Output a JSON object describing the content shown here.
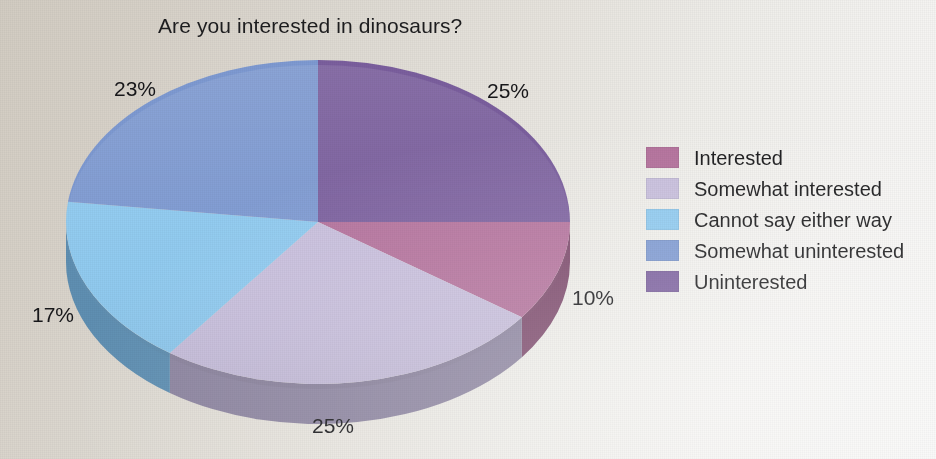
{
  "chart_data": {
    "type": "pie",
    "title": "Are you interested in dinosaurs?",
    "xlabel": "",
    "ylabel": "",
    "legend_position": "right",
    "grid": false,
    "three_d": true,
    "categories": [
      "Interested",
      "Somewhat interested",
      "Cannot say either way",
      "Somewhat uninterested",
      "Uninterested"
    ],
    "values": [
      10,
      25,
      17,
      23,
      25
    ],
    "value_labels": [
      "10%",
      "25%",
      "17%",
      "23%",
      "25%"
    ],
    "colors": [
      "#b4719c",
      "#c8bfdd",
      "#8fcaf0",
      "#7e9ad2",
      "#7b5f9e"
    ],
    "side_colors": [
      "#7d4a6c",
      "#8d85a0",
      "#5f8fb2",
      "#5a6f99",
      "#553f70"
    ]
  },
  "title": {
    "text": "Are you interested in dinosaurs?"
  },
  "pie": {
    "slices": [
      {
        "label": "Uninterested",
        "pct": "25%",
        "value": 25,
        "color": "#7b5f9e",
        "side": "#553f70"
      },
      {
        "label": "Interested",
        "pct": "10%",
        "value": 10,
        "color": "#b4719c",
        "side": "#7d4a6c"
      },
      {
        "label": "Somewhat interested",
        "pct": "25%",
        "value": 25,
        "color": "#c8bfdd",
        "side": "#8d85a0"
      },
      {
        "label": "Cannot say either way",
        "pct": "17%",
        "value": 17,
        "color": "#8fcaf0",
        "side": "#5f8fb2"
      },
      {
        "label": "Somewhat uninterested",
        "pct": "23%",
        "value": 23,
        "color": "#7e9ad2",
        "side": "#5a6f99"
      }
    ]
  },
  "legend": {
    "items": [
      {
        "label": "Interested",
        "color": "#b4719c"
      },
      {
        "label": "Somewhat interested",
        "color": "#c8bfdd"
      },
      {
        "label": "Cannot say either way",
        "color": "#8fcaf0"
      },
      {
        "label": "Somewhat uninterested",
        "color": "#7e9ad2"
      },
      {
        "label": "Uninterested",
        "color": "#7b5f9e"
      }
    ]
  }
}
